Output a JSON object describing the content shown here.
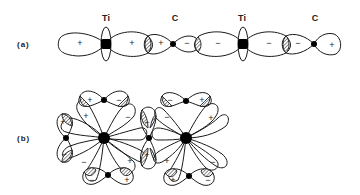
{
  "figure": {
    "panel_a": {
      "label": "(a)",
      "atoms": [
        {
          "symbol": "Ti",
          "x": 106
        },
        {
          "symbol": "C",
          "x": 173
        },
        {
          "symbol": "Ti",
          "x": 243
        },
        {
          "symbol": "C",
          "x": 314
        }
      ],
      "signs": [
        "+",
        "+",
        "+",
        "−",
        "−",
        "−",
        "−",
        "+"
      ]
    },
    "panel_b": {
      "label": "(b)",
      "signs": {
        "left_top_left": "+",
        "left_top_right": "−",
        "left_upper_left_inner": "+",
        "left_upper_right_inner": "−",
        "left_left_top": "+",
        "left_left_bottom": "−",
        "left_lower_left_inner": "−",
        "left_lower_right_inner": "+",
        "left_bottom_left": "−",
        "left_bottom_right": "+",
        "mid_top": "−",
        "mid_bottom": "+",
        "right_top_left": "−",
        "right_top_right": "+",
        "right_upper_left_inner": "−",
        "right_upper_right_inner": "+",
        "right_lower_left_inner": "+",
        "right_lower_right_inner": "−",
        "right_bottom_left": "+",
        "right_bottom_right": "−"
      }
    }
  }
}
